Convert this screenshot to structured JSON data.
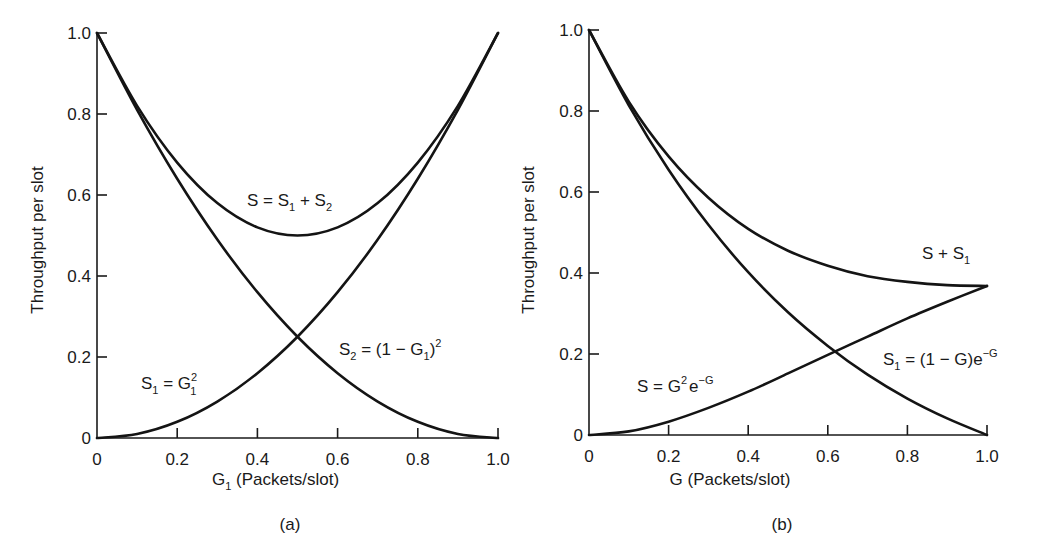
{
  "chart_data": [
    {
      "type": "line",
      "panel_label": "(a)",
      "title": "",
      "xlabel": "G1 (Packets/slot)",
      "xlabel_main": "G",
      "xlabel_sub": "1",
      "xlabel_rest": " (Packets/slot)",
      "ylabel": "Throughput per slot",
      "xlim": [
        0,
        1.0
      ],
      "ylim": [
        0,
        1.0
      ],
      "x_ticks": [
        "0",
        "0.2",
        "0.4",
        "0.6",
        "0.8",
        "1.0"
      ],
      "y_ticks": [
        "0",
        "0.2",
        "0.4",
        "0.6",
        "0.8",
        "1.0"
      ],
      "grid": false,
      "x": [
        0,
        0.1,
        0.2,
        0.3,
        0.4,
        0.5,
        0.6,
        0.7,
        0.8,
        0.9,
        1.0
      ],
      "series": [
        {
          "name": "S1 = G1^2",
          "values": [
            0,
            0.01,
            0.04,
            0.09,
            0.16,
            0.25,
            0.36,
            0.49,
            0.64,
            0.81,
            1.0
          ]
        },
        {
          "name": "S2 = (1 - G1)^2",
          "values": [
            1.0,
            0.81,
            0.64,
            0.49,
            0.36,
            0.25,
            0.16,
            0.09,
            0.04,
            0.01,
            0
          ]
        },
        {
          "name": "S = S1 + S2",
          "values": [
            1.0,
            0.82,
            0.68,
            0.58,
            0.52,
            0.5,
            0.52,
            0.58,
            0.68,
            0.82,
            1.0
          ]
        }
      ],
      "annotations": [
        {
          "text": "S = S1 + S2",
          "x": 0.5,
          "y": 0.56
        },
        {
          "text": "S1 = G1^2",
          "x": 0.15,
          "y": 0.1
        },
        {
          "text": "S2 = (1 - G1)^2",
          "x": 0.7,
          "y": 0.2
        }
      ]
    },
    {
      "type": "line",
      "panel_label": "(b)",
      "title": "",
      "xlabel": "G (Packets/slot)",
      "ylabel": "Throughput per slot",
      "xlim": [
        0,
        1.0
      ],
      "ylim": [
        0,
        1.0
      ],
      "x_ticks": [
        "0",
        "0.2",
        "0.4",
        "0.6",
        "0.8",
        "1.0"
      ],
      "y_ticks": [
        "0",
        "0.2",
        "0.4",
        "0.6",
        "0.8",
        "1.0"
      ],
      "grid": false,
      "x": [
        0,
        0.1,
        0.2,
        0.3,
        0.4,
        0.5,
        0.6,
        0.7,
        0.8,
        0.9,
        1.0
      ],
      "series": [
        {
          "name": "S = G^2 e^-G",
          "values": [
            0,
            0.009,
            0.033,
            0.067,
            0.107,
            0.152,
            0.198,
            0.243,
            0.288,
            0.329,
            0.368
          ]
        },
        {
          "name": "S1 = (1 - G) e^-G",
          "values": [
            1.0,
            0.814,
            0.655,
            0.519,
            0.402,
            0.303,
            0.22,
            0.149,
            0.09,
            0.041,
            0
          ]
        },
        {
          "name": "S + S1",
          "values": [
            1.0,
            0.823,
            0.688,
            0.586,
            0.509,
            0.455,
            0.418,
            0.392,
            0.378,
            0.37,
            0.368
          ]
        }
      ],
      "annotations": [
        {
          "text": "S + S1",
          "x": 0.88,
          "y": 0.43
        },
        {
          "text": "S = G^2 e^-G",
          "x": 0.3,
          "y": 0.1
        },
        {
          "text": "S1 = (1 - G)e^-G",
          "x": 0.85,
          "y": 0.2
        }
      ]
    }
  ],
  "panels": {
    "a": {
      "caption": "(a)",
      "ylabel": "Throughput per slot",
      "label_S": "S = S",
      "label_S_sub1": "1",
      "label_S_plus": " + S",
      "label_S_sub2": "2",
      "label_S1": "S",
      "label_S1_sub": "1",
      "label_S1_eq": " = G",
      "label_S1_sup": "2",
      "label_S1_sub2": "1",
      "label_S2": "S",
      "label_S2_sub": "2",
      "label_S2_eq": " = (1 − G",
      "label_S2_sub2": "1",
      "label_S2_close": ")",
      "label_S2_sup": "2"
    },
    "b": {
      "caption": "(b)",
      "ylabel": "Throughput per slot",
      "label_sum": "S + S",
      "label_sum_sub": "1",
      "label_S": "S = G",
      "label_S_sup": "2",
      "label_S_e": "e",
      "label_S_exp": "−G",
      "label_S1": "S",
      "label_S1_sub": "1",
      "label_S1_eq": " = (1 − G)e",
      "label_S1_exp": "−G"
    }
  }
}
